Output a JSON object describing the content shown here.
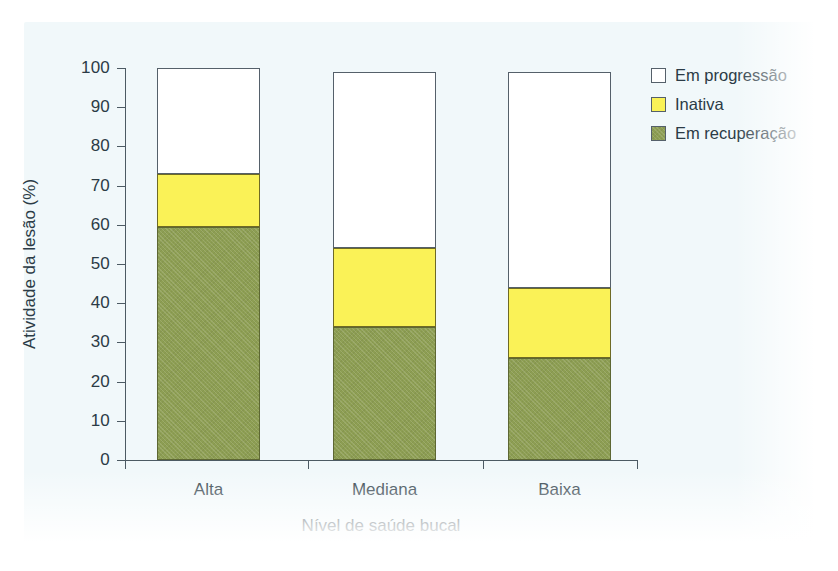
{
  "chart_data": {
    "type": "bar",
    "stacked": true,
    "stacked_mode": "absolute-percent",
    "title": "",
    "xlabel": "Nível de saúde bucal",
    "ylabel": "Atividade da lesão (%)",
    "categories": [
      "Alta",
      "Mediana",
      "Baixa"
    ],
    "ylim": [
      0,
      100
    ],
    "yticks": [
      0,
      10,
      20,
      30,
      40,
      50,
      60,
      70,
      80,
      90,
      100
    ],
    "ytick_labels": [
      "0",
      "10",
      "20",
      "30",
      "40",
      "50",
      "60",
      "70",
      "80",
      "90",
      "100"
    ],
    "grid": false,
    "legend_position": "right-top",
    "series": [
      {
        "name": "Em recuperação",
        "color": "#8d9e53",
        "border_color": "#5d6733",
        "values": [
          59.5,
          34,
          26
        ]
      },
      {
        "name": "Inativa",
        "color": "#faf257",
        "border_color": "#6e6a25",
        "values": [
          13.5,
          20,
          18
        ]
      },
      {
        "name": "Em progressão",
        "color": "#ffffff",
        "border_color": "#55606a",
        "values": [
          27,
          45,
          55
        ]
      }
    ],
    "totals": [
      100,
      99,
      99
    ],
    "annotations": []
  },
  "axes": {
    "y_title": "Atividade da lesão (%)",
    "x_title": "Nível de saúde bucal"
  },
  "legend": {
    "items": [
      {
        "label": "Em progressão",
        "swatch": "legend-swatch-progress"
      },
      {
        "label": "Inativa",
        "swatch": "legend-swatch-inactive"
      },
      {
        "label": "Em recuperação",
        "swatch": "legend-swatch-recovery"
      }
    ]
  }
}
